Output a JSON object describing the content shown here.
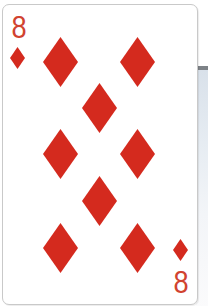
{
  "card": {
    "rank": "8",
    "suit": "diamonds",
    "suit_icon": "diamond-icon",
    "colors": {
      "suit": "#d42a1e",
      "index": "#d1432f",
      "card_face": "#ffffff",
      "card_border": "#c9c9c9"
    },
    "corners": [
      {
        "position": "top-left",
        "rank": "8",
        "suit": "diamonds"
      },
      {
        "position": "bottom-right",
        "rank": "8",
        "suit": "diamonds"
      }
    ],
    "pips": [
      {
        "x": 60,
        "y": 62
      },
      {
        "x": 137,
        "y": 62
      },
      {
        "x": 99,
        "y": 108
      },
      {
        "x": 60,
        "y": 154
      },
      {
        "x": 137,
        "y": 154
      },
      {
        "x": 99,
        "y": 201
      },
      {
        "x": 60,
        "y": 248
      },
      {
        "x": 137,
        "y": 248
      }
    ]
  }
}
